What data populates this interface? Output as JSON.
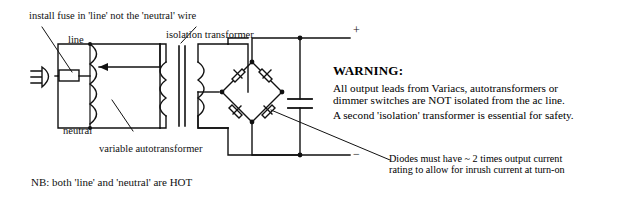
{
  "figure": {
    "type": "circuit-schematic"
  },
  "annotations": {
    "fuse_note": "install fuse in 'line' not the 'neutral' wire",
    "line_label": "line",
    "neutral_label": "neutral",
    "autotransformer_label": "variable autotransformer",
    "isolation_label": "isolation transformer",
    "nb_note": "NB: both 'line' and 'neutral' are HOT"
  },
  "terminals": {
    "positive": "+",
    "negative": "−"
  },
  "warning": {
    "heading": "WARNING:",
    "line1": "All output leads from Variacs, autotransformers or",
    "line2": "dimmer switches are NOT isolated from the ac line.",
    "line3": "A second 'isolation' transformer is essential for safety."
  },
  "diode_note": {
    "line1": "Diodes must have ~ 2 times output current",
    "line2": "rating to allow for inrush current at turn-on"
  },
  "components": {
    "plug": "ac-mains-plug",
    "fuse": "fuse",
    "autotransformer": "variable-autotransformer-coil",
    "wiper": "wiper-arrow",
    "transformer": "isolation-transformer",
    "bridge": "bridge-rectifier",
    "diode_count": 4,
    "capacitor": "filter-capacitor"
  },
  "colors": {
    "ink": "#111111",
    "paper": "#ffffff"
  }
}
